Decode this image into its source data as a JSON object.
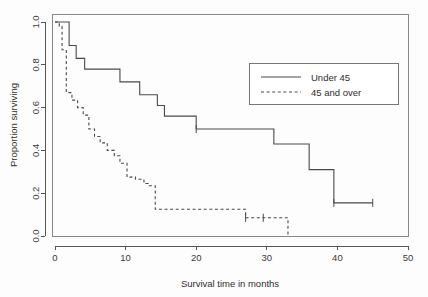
{
  "figure": {
    "background_color": "#fdfdfd",
    "line_color": "#4a4a4a",
    "frame_color": "#888888"
  },
  "chart_data": {
    "type": "line",
    "title": "",
    "xlabel": "Survival time in months",
    "ylabel": "Proportion surviving",
    "xlim": [
      0,
      50
    ],
    "ylim": [
      0,
      1.0
    ],
    "xticks": [
      0,
      10,
      20,
      30,
      40,
      50
    ],
    "xtick_labels": [
      "0",
      "10",
      "20",
      "30",
      "40",
      "50"
    ],
    "yticks": [
      0.0,
      0.2,
      0.4,
      0.6,
      0.8,
      1.0
    ],
    "ytick_labels": [
      "0.0",
      "0.2",
      "0.4",
      "0.6",
      "0.8",
      "1.0"
    ],
    "grid": false,
    "legend_position": "upper right",
    "step_style": "post",
    "series": [
      {
        "name": "Under 45",
        "style": "solid",
        "x": [
          0,
          1.2,
          2.0,
          3.0,
          4.2,
          8.0,
          9.2,
          12.0,
          14.5,
          15.5,
          18.2,
          20.0,
          24.0,
          31.0,
          36.0,
          39.5,
          45.0
        ],
        "y": [
          1.0,
          1.0,
          0.89,
          0.83,
          0.78,
          0.78,
          0.72,
          0.66,
          0.61,
          0.56,
          0.56,
          0.5,
          0.5,
          0.43,
          0.31,
          0.155,
          0.155
        ],
        "censor_x": [
          20.0,
          39.5,
          45.0
        ],
        "censor_y": [
          0.5,
          0.155,
          0.155
        ]
      },
      {
        "name": "45 and over",
        "style": "dashed",
        "x": [
          0,
          0.6,
          1.0,
          1.6,
          2.4,
          3.2,
          4.0,
          4.8,
          5.6,
          6.4,
          7.4,
          8.4,
          9.2,
          10.2,
          11.4,
          12.6,
          13.2,
          14.2,
          18.2,
          27.0,
          29.5,
          33.0
        ],
        "y": [
          1.0,
          0.98,
          0.87,
          0.67,
          0.635,
          0.6,
          0.565,
          0.5,
          0.465,
          0.435,
          0.4,
          0.375,
          0.34,
          0.275,
          0.265,
          0.245,
          0.235,
          0.125,
          0.125,
          0.085,
          0.085,
          0.085
        ],
        "drop_to_zero_at": 33.0,
        "censor_x": [
          27.0,
          29.5
        ],
        "censor_y": [
          0.085,
          0.085
        ]
      }
    ]
  },
  "legend": {
    "entries": [
      {
        "label": "Under 45",
        "style": "solid"
      },
      {
        "label": "45 and over",
        "style": "dashed"
      }
    ]
  }
}
